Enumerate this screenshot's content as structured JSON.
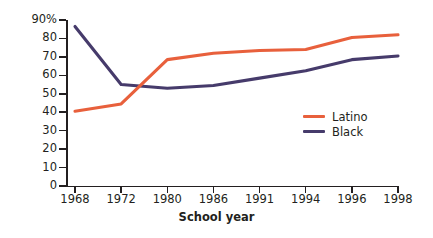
{
  "chart_data": {
    "type": "line",
    "title": "",
    "xlabel": "School year",
    "ylabel": "",
    "categories": [
      "1968",
      "1972",
      "1980",
      "1986",
      "1991",
      "1994",
      "1996",
      "1998"
    ],
    "ylim": [
      0,
      90
    ],
    "ytick_labels": [
      "90%",
      "80",
      "70",
      "60",
      "50",
      "40",
      "30",
      "20",
      "10",
      "0"
    ],
    "ytick_values": [
      90,
      80,
      70,
      60,
      50,
      40,
      30,
      20,
      10,
      0
    ],
    "grid": false,
    "legend_position": "inside-right",
    "series": [
      {
        "name": "Latino",
        "color": "#E8603C",
        "values": [
          40.5,
          44.5,
          68.5,
          72,
          73.5,
          74,
          80.5,
          82
        ]
      },
      {
        "name": "Black",
        "color": "#463B6B",
        "values": [
          86.5,
          55,
          53,
          54.5,
          58.5,
          62.5,
          68.5,
          70.5
        ]
      }
    ]
  },
  "axis_title": "School year",
  "legend": {
    "items": [
      {
        "label": "Latino",
        "color": "#E8603C"
      },
      {
        "label": "Black",
        "color": "#463B6B"
      }
    ]
  }
}
